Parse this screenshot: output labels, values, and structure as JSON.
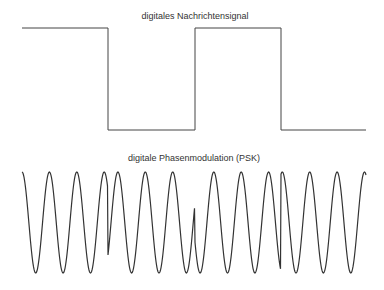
{
  "diagram": {
    "top_title": "digitales Nachrichtensignal",
    "bottom_title": "digitale Phasenmodulation (PSK)",
    "line_color": "#444444",
    "digital_signal": {
      "bits": [
        1,
        0,
        1,
        0
      ],
      "segments_x": [
        [
          22,
          108
        ],
        [
          108,
          195
        ],
        [
          195,
          281
        ],
        [
          281,
          366
        ]
      ],
      "high_y": 28,
      "low_y": 130
    },
    "psk_signal": {
      "x_start": 22,
      "x_end": 366,
      "top_y": 172,
      "bottom_y": 273,
      "period_px": 27.4,
      "phase_shift_at_bit_change_rad": 3.14159
    }
  }
}
